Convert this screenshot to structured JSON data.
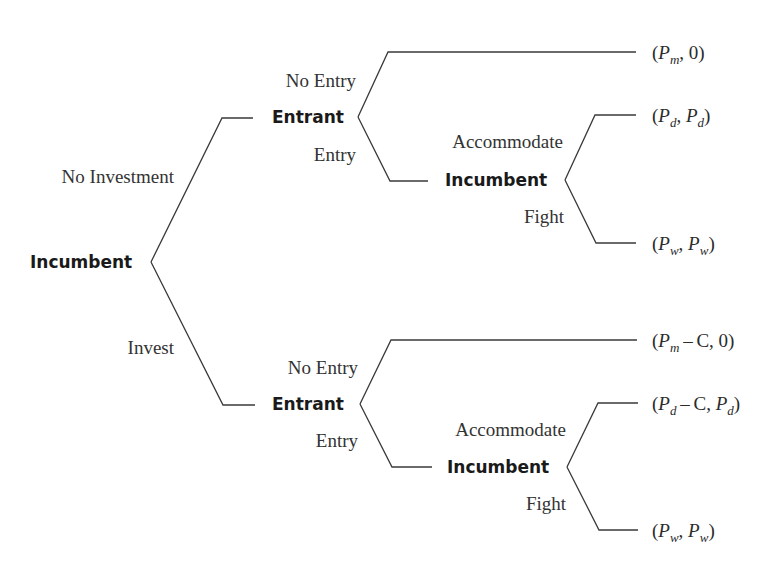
{
  "diagram": {
    "type": "extensive-form game tree",
    "stroke_color": "#3a3a3a",
    "text_color": "#2b2b2b"
  },
  "nodes": {
    "root": {
      "label": "Incumbent",
      "x": 30,
      "y": 262
    },
    "upper_entrant": {
      "label": "Entrant",
      "x": 272,
      "y": 117
    },
    "upper_incumbent": {
      "label": "Incumbent",
      "x": 445,
      "y": 180
    },
    "lower_entrant": {
      "label": "Entrant",
      "x": 272,
      "y": 404
    },
    "lower_incumbent": {
      "label": "Incumbent",
      "x": 447,
      "y": 467
    }
  },
  "actions": {
    "no_investment": {
      "label": "No Investment",
      "right": 174,
      "y": 176
    },
    "invest": {
      "label": "Invest",
      "right": 174,
      "y": 347
    },
    "upper_no_entry": {
      "label": "No Entry",
      "right": 356,
      "y": 80
    },
    "upper_entry": {
      "label": "Entry",
      "right": 356,
      "y": 154
    },
    "upper_accommodate": {
      "label": "Accommodate",
      "right": 563,
      "y": 141
    },
    "upper_fight": {
      "label": "Fight",
      "right": 564,
      "y": 216
    },
    "lower_no_entry": {
      "label": "No Entry",
      "right": 358,
      "y": 367
    },
    "lower_entry": {
      "label": "Entry",
      "right": 358,
      "y": 440
    },
    "lower_accommodate": {
      "label": "Accommodate",
      "right": 566,
      "y": 429
    },
    "lower_fight": {
      "label": "Fight",
      "right": 566,
      "y": 503
    }
  },
  "payoffs": [
    {
      "id": "no_invest_no_entry",
      "y": 52,
      "parts": [
        {
          "t": "("
        },
        {
          "v": "P",
          "s": "m"
        },
        {
          "t": ", 0)"
        }
      ],
      "text": "(P_m, 0)"
    },
    {
      "id": "no_invest_entry_accommodate",
      "y": 115,
      "parts": [
        {
          "t": "("
        },
        {
          "v": "P",
          "s": "d"
        },
        {
          "t": ", "
        },
        {
          "v": "P",
          "s": "d"
        },
        {
          "t": ")"
        }
      ],
      "text": "(P_d, P_d)"
    },
    {
      "id": "no_invest_entry_fight",
      "y": 243,
      "parts": [
        {
          "t": "("
        },
        {
          "v": "P",
          "s": "w"
        },
        {
          "t": ", "
        },
        {
          "v": "P",
          "s": "w"
        },
        {
          "t": ")"
        }
      ],
      "text": "(P_w, P_w)"
    },
    {
      "id": "invest_no_entry",
      "y": 340,
      "parts": [
        {
          "t": "("
        },
        {
          "v": "P",
          "s": "m"
        },
        {
          "t": " – C, 0)"
        }
      ],
      "text": "(P_m – C, 0)"
    },
    {
      "id": "invest_entry_accommodate",
      "y": 403,
      "parts": [
        {
          "t": "("
        },
        {
          "v": "P",
          "s": "d"
        },
        {
          "t": " – C, "
        },
        {
          "v": "P",
          "s": "d"
        },
        {
          "t": ")"
        }
      ],
      "text": "(P_d – C, P_d)"
    },
    {
      "id": "invest_entry_fight",
      "y": 530,
      "parts": [
        {
          "t": "("
        },
        {
          "v": "P",
          "s": "w"
        },
        {
          "t": ", "
        },
        {
          "v": "P",
          "s": "w"
        },
        {
          "t": ")"
        }
      ],
      "text": "(P_w, P_w)"
    }
  ],
  "payoff_x": 652,
  "edges": [
    {
      "name": "edge-no-investment",
      "points": "151,262 222,118 253,118"
    },
    {
      "name": "edge-invest",
      "points": "151,262 223,405 255,405"
    },
    {
      "name": "edge-upper-no-entry",
      "points": "358,117 388,52 636,52"
    },
    {
      "name": "edge-upper-entry",
      "points": "358,117 390,181 428,181"
    },
    {
      "name": "edge-upper-accommodate",
      "points": "565,180 595,115 636,115"
    },
    {
      "name": "edge-upper-fight",
      "points": "565,180 596,243 636,243"
    },
    {
      "name": "edge-lower-no-entry",
      "points": "360,404 391,340 637,340"
    },
    {
      "name": "edge-lower-entry",
      "points": "360,404 392,467 432,467"
    },
    {
      "name": "edge-lower-accommodate",
      "points": "567,467 598,403 638,403"
    },
    {
      "name": "edge-lower-fight",
      "points": "567,467 599,530 638,530"
    }
  ]
}
